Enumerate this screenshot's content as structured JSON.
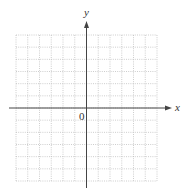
{
  "chart_data": {
    "type": "scatter",
    "title": "",
    "xlabel": "x",
    "ylabel": "y",
    "origin_label": "0",
    "grid": true,
    "grid_style": "dotted",
    "grid_columns": 12,
    "grid_rows": 12,
    "x_axis_position_row": 6,
    "y_axis_position_col": 6,
    "series": [],
    "colors": {
      "axis": "#444444",
      "grid": "#b8b8b8"
    }
  }
}
